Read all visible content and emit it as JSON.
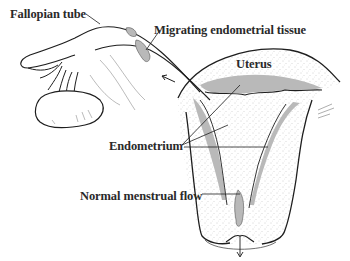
{
  "diagram": {
    "labels": {
      "fallopian_tube": "Fallopian tube",
      "migrating_tissue": "Migrating endometrial tissue",
      "uterus": "Uterus",
      "endometrium": "Endometrium",
      "normal_flow": "Normal menstrual flow"
    },
    "colors": {
      "outline": "#1e1e1e",
      "endometrium_fill": "#b9b9b9",
      "stipple": "#9a9a9a",
      "background": "#ffffff"
    }
  }
}
